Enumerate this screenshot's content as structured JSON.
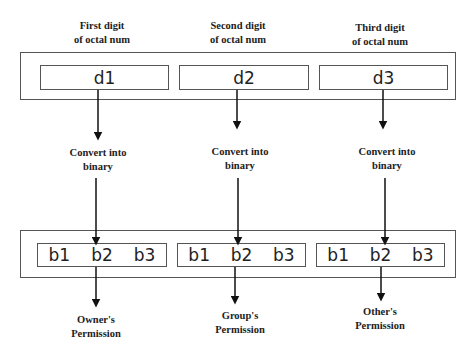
{
  "digits": {
    "headers": [
      {
        "line1": "First digit",
        "line2": "of octal num"
      },
      {
        "line1": "Second digit",
        "line2": "of octal num"
      },
      {
        "line1": "Third digit",
        "line2": "of octal num"
      }
    ],
    "values": [
      "d1",
      "d2",
      "d3"
    ]
  },
  "conversion": {
    "labels": [
      {
        "line1": "Convert into",
        "line2": "binary"
      },
      {
        "line1": "Convert into",
        "line2": "binary"
      },
      {
        "line1": "Convert into",
        "line2": "binary"
      }
    ]
  },
  "binary": {
    "groups": [
      {
        "bits": [
          "b1",
          "b2",
          "b3"
        ]
      },
      {
        "bits": [
          "b1",
          "b2",
          "b3"
        ]
      },
      {
        "bits": [
          "b1",
          "b2",
          "b3"
        ]
      }
    ]
  },
  "permissions": {
    "labels": [
      {
        "line1": "Owner's",
        "line2": "Permission"
      },
      {
        "line1": "Group's",
        "line2": "Permission"
      },
      {
        "line1": "Other's",
        "line2": "Permission"
      }
    ]
  },
  "colors": {
    "line": "#555555",
    "arrow": "#111111",
    "text": "#222222"
  }
}
